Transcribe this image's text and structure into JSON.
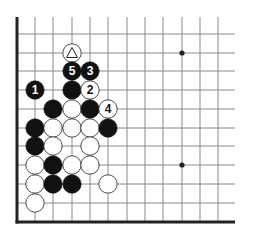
{
  "diagram": {
    "type": "go-board-fragment",
    "colors": {
      "background": "#ffffff",
      "grid_line": "#8a8a8a",
      "edge_line": "#222222",
      "black_stone": "#111111",
      "white_stone": "#ffffff",
      "stone_outline": "#333333",
      "star_point": "#222222"
    },
    "grid": {
      "x": [
        17,
        35,
        53,
        72,
        90,
        108,
        127,
        145,
        163,
        182,
        200,
        218
      ],
      "y": [
        34,
        53,
        71,
        90,
        109,
        128,
        146,
        165,
        184,
        203,
        222
      ],
      "top_open_end": 17,
      "right_open_end": 235,
      "edges": [
        "left",
        "bottom"
      ]
    },
    "star_points": [
      {
        "col": 9,
        "row": 1
      },
      {
        "col": 9,
        "row": 7
      }
    ],
    "stones": [
      {
        "col": 3,
        "row": 1,
        "color": "white",
        "marker": "triangle",
        "label": ""
      },
      {
        "col": 3,
        "row": 2,
        "color": "black",
        "label": "5"
      },
      {
        "col": 4,
        "row": 2,
        "color": "black",
        "label": "3"
      },
      {
        "col": 1,
        "row": 3,
        "color": "black",
        "label": "1"
      },
      {
        "col": 3,
        "row": 3,
        "color": "black",
        "label": ""
      },
      {
        "col": 4,
        "row": 3,
        "color": "white",
        "label": "2"
      },
      {
        "col": 2,
        "row": 4,
        "color": "black",
        "label": ""
      },
      {
        "col": 3,
        "row": 4,
        "color": "white",
        "label": ""
      },
      {
        "col": 4,
        "row": 4,
        "color": "black",
        "label": ""
      },
      {
        "col": 5,
        "row": 4,
        "color": "white",
        "label": "4"
      },
      {
        "col": 1,
        "row": 5,
        "color": "black",
        "label": ""
      },
      {
        "col": 2,
        "row": 5,
        "color": "white",
        "label": ""
      },
      {
        "col": 3,
        "row": 5,
        "color": "white",
        "label": ""
      },
      {
        "col": 4,
        "row": 5,
        "color": "white",
        "label": ""
      },
      {
        "col": 5,
        "row": 5,
        "color": "black",
        "label": ""
      },
      {
        "col": 1,
        "row": 6,
        "color": "black",
        "label": ""
      },
      {
        "col": 2,
        "row": 6,
        "color": "white",
        "label": ""
      },
      {
        "col": 4,
        "row": 6,
        "color": "white",
        "label": ""
      },
      {
        "col": 1,
        "row": 7,
        "color": "white",
        "label": ""
      },
      {
        "col": 2,
        "row": 7,
        "color": "black",
        "label": ""
      },
      {
        "col": 3,
        "row": 7,
        "color": "white",
        "label": ""
      },
      {
        "col": 4,
        "row": 7,
        "color": "white",
        "label": ""
      },
      {
        "col": 1,
        "row": 8,
        "color": "white",
        "label": ""
      },
      {
        "col": 2,
        "row": 8,
        "color": "black",
        "label": ""
      },
      {
        "col": 3,
        "row": 8,
        "color": "black",
        "label": ""
      },
      {
        "col": 5,
        "row": 8,
        "color": "white",
        "label": ""
      },
      {
        "col": 1,
        "row": 9,
        "color": "white",
        "label": ""
      }
    ]
  }
}
